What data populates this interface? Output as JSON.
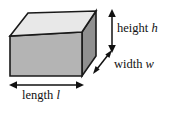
{
  "figure": {
    "background_color": "#ffffff",
    "shape": {
      "name": "rectangular box",
      "faces": {
        "top_color": "#e8e8e8",
        "front_color": "#b4b4b4",
        "right_color": "#909090",
        "outline_color": "#1a1a1a"
      }
    },
    "labels": {
      "height": {
        "word": "height",
        "variable": "h"
      },
      "width": {
        "word": "width",
        "variable": "w"
      },
      "length": {
        "word": "length",
        "variable": "l"
      }
    },
    "arrows": {
      "height_arrow": "vertical-double-headed-arrow",
      "width_arrow": "diagonal-double-headed-arrow",
      "length_arrow": "horizontal-double-headed-arrow",
      "color": "#111111"
    }
  }
}
